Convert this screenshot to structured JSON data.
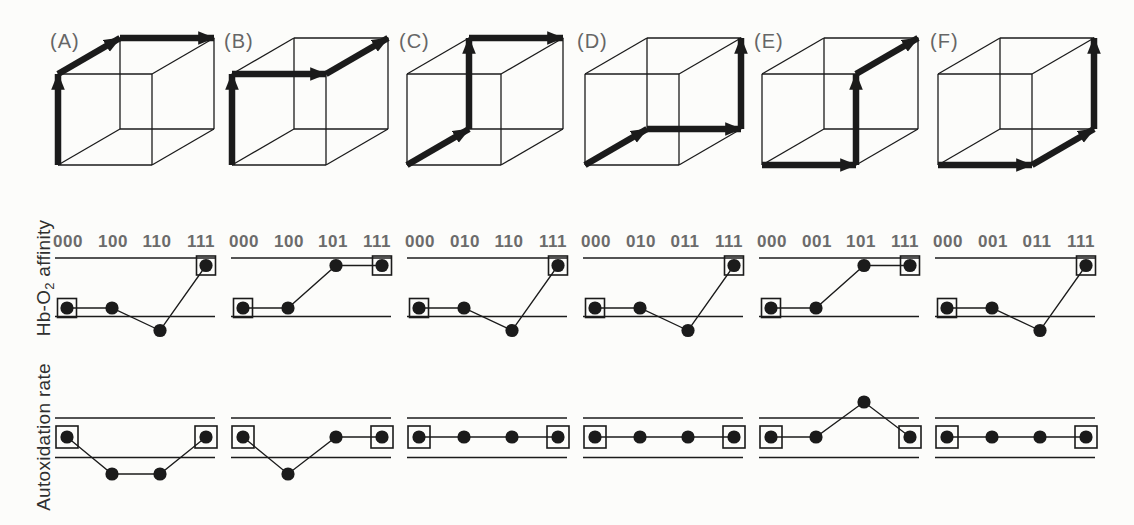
{
  "figure": {
    "width": 1134,
    "height": 525,
    "background": "#fcfcfa",
    "ink": "#1b1b1b",
    "label_gray": "#6b6b6b",
    "letter_gray": "#666666"
  },
  "captions": {
    "affinity": {
      "pre": "Hb-O",
      "sub": "2",
      "post": " affinity"
    },
    "autoxidation": "Autoxidation rate"
  },
  "panels": [
    {
      "letter": "(A)",
      "cube_path": [
        "FBL",
        "FTL",
        "BTL",
        "BTR"
      ],
      "genotype_sequence": [
        "000",
        "100",
        "110",
        "111"
      ],
      "affinity_levels": [
        "low",
        "low",
        "dip",
        "high"
      ],
      "autoxidation_levels": [
        "mid",
        "dip",
        "dip",
        "mid"
      ],
      "boxed_points": [
        0,
        3
      ]
    },
    {
      "letter": "(B)",
      "cube_path": [
        "FBL",
        "FTL",
        "FTR",
        "BTR"
      ],
      "genotype_sequence": [
        "000",
        "100",
        "101",
        "111"
      ],
      "affinity_levels": [
        "low",
        "low",
        "high",
        "high"
      ],
      "autoxidation_levels": [
        "mid",
        "dip",
        "mid",
        "mid"
      ],
      "boxed_points": [
        0,
        3
      ]
    },
    {
      "letter": "(C)",
      "cube_path": [
        "FBL",
        "BBL",
        "BTL",
        "BTR"
      ],
      "genotype_sequence": [
        "000",
        "010",
        "110",
        "111"
      ],
      "affinity_levels": [
        "low",
        "low",
        "dip",
        "high"
      ],
      "autoxidation_levels": [
        "mid",
        "mid",
        "mid",
        "mid"
      ],
      "boxed_points": [
        0,
        3
      ]
    },
    {
      "letter": "(D)",
      "cube_path": [
        "FBL",
        "BBL",
        "BBR",
        "BTR"
      ],
      "genotype_sequence": [
        "000",
        "010",
        "011",
        "111"
      ],
      "affinity_levels": [
        "low",
        "low",
        "dip",
        "high"
      ],
      "autoxidation_levels": [
        "mid",
        "mid",
        "mid",
        "mid"
      ],
      "boxed_points": [
        0,
        3
      ]
    },
    {
      "letter": "(E)",
      "cube_path": [
        "FBL",
        "FBR",
        "FTR",
        "BTR"
      ],
      "genotype_sequence": [
        "000",
        "001",
        "101",
        "111"
      ],
      "affinity_levels": [
        "low",
        "low",
        "high",
        "high"
      ],
      "autoxidation_levels": [
        "mid",
        "mid",
        "peak",
        "mid"
      ],
      "boxed_points": [
        0,
        3
      ]
    },
    {
      "letter": "(F)",
      "cube_path": [
        "FBL",
        "FBR",
        "BBR",
        "BTR"
      ],
      "genotype_sequence": [
        "000",
        "001",
        "011",
        "111"
      ],
      "affinity_levels": [
        "low",
        "low",
        "dip",
        "high"
      ],
      "autoxidation_levels": [
        "mid",
        "mid",
        "mid",
        "mid"
      ],
      "boxed_points": [
        0,
        3
      ]
    }
  ]
}
